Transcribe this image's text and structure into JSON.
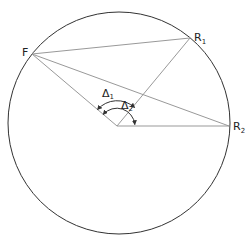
{
  "diagram": {
    "width": 249,
    "height": 242,
    "circle": {
      "cx": 119,
      "cy": 123,
      "r": 111,
      "stroke": "#333333"
    },
    "center": {
      "x": 117,
      "y": 126
    },
    "points": {
      "F": {
        "x": 32,
        "y": 54,
        "label": "F"
      },
      "R1": {
        "x": 190,
        "y": 38,
        "label": "R",
        "sub": "1"
      },
      "R2": {
        "x": 229,
        "y": 126,
        "label": "R",
        "sub": "2"
      }
    },
    "angles": {
      "delta1": {
        "label": "Δ",
        "sub": "1"
      },
      "delta2": {
        "label": "Δ",
        "sub": "2"
      }
    },
    "line_color": "#999999",
    "text_color": "#222222"
  }
}
